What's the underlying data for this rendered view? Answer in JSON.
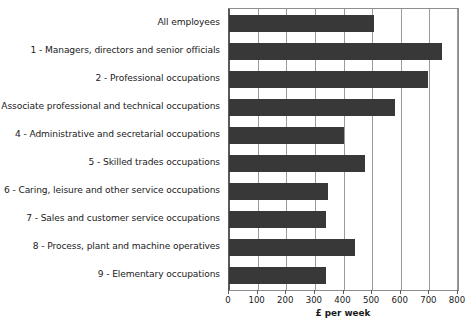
{
  "chart_data": {
    "type": "bar",
    "orientation": "horizontal",
    "title": "",
    "xlabel": "£ per week",
    "ylabel": "",
    "xlim": [
      0,
      800
    ],
    "xticks": [
      0,
      100,
      200,
      300,
      400,
      500,
      600,
      700,
      800
    ],
    "xtick_labels": [
      "0",
      "100",
      "200",
      "300",
      "400",
      "500",
      "600",
      "700",
      "800"
    ],
    "grid": true,
    "legend": null,
    "bar_color": "#383838",
    "categories": [
      "All employees",
      "1 - Managers, directors and senior officials",
      "2 - Professional occupations",
      "3 - Associate professional and technical occupations",
      "4 - Administrative and secretarial occupations",
      "5 - Skilled trades occupations",
      "6 - Caring, leisure and other service occupations",
      "7 - Sales and customer service occupations",
      "8 - Process, plant and machine operatives",
      "9 - Elementary occupations"
    ],
    "values": [
      505,
      745,
      695,
      580,
      400,
      475,
      345,
      340,
      440,
      340
    ]
  }
}
